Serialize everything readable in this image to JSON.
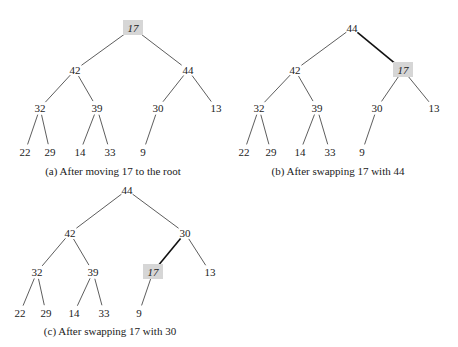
{
  "highlight_color": "#d6d6d6",
  "diagrams": [
    {
      "caption": "(a) After moving 17 to the root",
      "caption_pos": [
        113,
        175
      ],
      "highlight": 0,
      "nodes": [
        {
          "label": "17",
          "x": 133,
          "y": 28
        },
        {
          "label": "42",
          "x": 75,
          "y": 70
        },
        {
          "label": "44",
          "x": 188,
          "y": 70
        },
        {
          "label": "32",
          "x": 40,
          "y": 108
        },
        {
          "label": "39",
          "x": 97,
          "y": 108
        },
        {
          "label": "30",
          "x": 158,
          "y": 108
        },
        {
          "label": "13",
          "x": 216,
          "y": 108
        },
        {
          "label": "22",
          "x": 25,
          "y": 152
        },
        {
          "label": "29",
          "x": 50,
          "y": 152
        },
        {
          "label": "14",
          "x": 80,
          "y": 152
        },
        {
          "label": "33",
          "x": 110,
          "y": 152
        },
        {
          "label": "9",
          "x": 143,
          "y": 152
        }
      ],
      "edges": [
        [
          0,
          1
        ],
        [
          0,
          2
        ],
        [
          1,
          3
        ],
        [
          1,
          4
        ],
        [
          2,
          5
        ],
        [
          2,
          6
        ],
        [
          3,
          7
        ],
        [
          3,
          8
        ],
        [
          4,
          9
        ],
        [
          4,
          10
        ],
        [
          5,
          11
        ]
      ],
      "bold_edges": []
    },
    {
      "caption": "(b) After swapping 17 with 44",
      "caption_pos": [
        338,
        175
      ],
      "highlight": 2,
      "nodes": [
        {
          "label": "44",
          "x": 352,
          "y": 28
        },
        {
          "label": "42",
          "x": 295,
          "y": 70
        },
        {
          "label": "17",
          "x": 403,
          "y": 70
        },
        {
          "label": "32",
          "x": 259,
          "y": 108
        },
        {
          "label": "39",
          "x": 317,
          "y": 108
        },
        {
          "label": "30",
          "x": 377,
          "y": 108
        },
        {
          "label": "13",
          "x": 434,
          "y": 108
        },
        {
          "label": "22",
          "x": 244,
          "y": 152
        },
        {
          "label": "29",
          "x": 271,
          "y": 152
        },
        {
          "label": "14",
          "x": 300,
          "y": 152
        },
        {
          "label": "33",
          "x": 330,
          "y": 152
        },
        {
          "label": "9",
          "x": 362,
          "y": 152
        }
      ],
      "edges": [
        [
          0,
          1
        ],
        [
          0,
          2
        ],
        [
          1,
          3
        ],
        [
          1,
          4
        ],
        [
          2,
          5
        ],
        [
          2,
          6
        ],
        [
          3,
          7
        ],
        [
          3,
          8
        ],
        [
          4,
          9
        ],
        [
          4,
          10
        ],
        [
          5,
          11
        ]
      ],
      "bold_edges": [
        [
          0,
          2
        ]
      ]
    },
    {
      "caption": "(c) After swapping 17 with 30",
      "caption_pos": [
        110,
        335
      ],
      "highlight": 5,
      "nodes": [
        {
          "label": "44",
          "x": 127,
          "y": 190
        },
        {
          "label": "42",
          "x": 70,
          "y": 233
        },
        {
          "label": "30",
          "x": 185,
          "y": 233
        },
        {
          "label": "32",
          "x": 37,
          "y": 272
        },
        {
          "label": "39",
          "x": 93,
          "y": 272
        },
        {
          "label": "17",
          "x": 153,
          "y": 272
        },
        {
          "label": "13",
          "x": 210,
          "y": 272
        },
        {
          "label": "22",
          "x": 20,
          "y": 313
        },
        {
          "label": "29",
          "x": 46,
          "y": 313
        },
        {
          "label": "14",
          "x": 74,
          "y": 313
        },
        {
          "label": "33",
          "x": 104,
          "y": 313
        },
        {
          "label": "9",
          "x": 139,
          "y": 313
        }
      ],
      "edges": [
        [
          0,
          1
        ],
        [
          0,
          2
        ],
        [
          1,
          3
        ],
        [
          1,
          4
        ],
        [
          2,
          5
        ],
        [
          2,
          6
        ],
        [
          3,
          7
        ],
        [
          3,
          8
        ],
        [
          4,
          9
        ],
        [
          4,
          10
        ],
        [
          5,
          11
        ]
      ],
      "bold_edges": [
        [
          2,
          5
        ]
      ]
    }
  ]
}
